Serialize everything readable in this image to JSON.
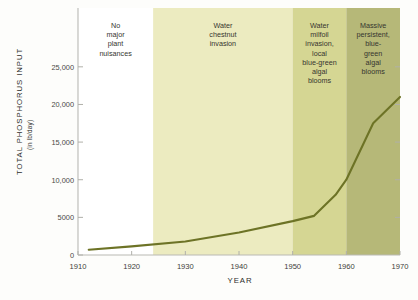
{
  "chart_data": {
    "type": "line",
    "title": "",
    "xlabel": "YEAR",
    "ylabel": "TOTAL PHOSPHORUS INPUT",
    "ylabel_units": "(in lb/day)",
    "xlim": [
      1910,
      1970
    ],
    "ylim": [
      0,
      27500
    ],
    "grid": false,
    "legend": "none",
    "xticks": [
      1910,
      1920,
      1930,
      1940,
      1950,
      1960,
      1970
    ],
    "xtick_labels": [
      "1910",
      "1920",
      "1930",
      "1940",
      "1950",
      "1960",
      "1970"
    ],
    "yticks": [
      0,
      5000,
      10000,
      15000,
      20000,
      25000
    ],
    "ytick_labels": [
      "0",
      "5000",
      "10,000",
      "15,000",
      "20,000",
      "25,000"
    ],
    "series": [
      {
        "name": "Total phosphorus input",
        "color": "#6d7326",
        "x": [
          1912,
          1920,
          1930,
          1940,
          1950,
          1954,
          1958,
          1960,
          1965,
          1970
        ],
        "values": [
          700,
          1150,
          1800,
          3000,
          4500,
          5200,
          8000,
          10000,
          17500,
          21000
        ]
      }
    ],
    "annotations": [
      {
        "label": "No major plant nuisances",
        "lines": [
          "No",
          "major",
          "plant",
          "nuisances"
        ],
        "x_start": 1910,
        "x_end": 1924,
        "color": "#ffffff"
      },
      {
        "label": "Water chestnut invasion",
        "lines": [
          "Water",
          "chestnut",
          "invasion"
        ],
        "x_start": 1924,
        "x_end": 1950,
        "color": "#ecebc0"
      },
      {
        "label": "Water milfoil invasion, local blue-green algal blooms",
        "lines": [
          "Water",
          "milfoil",
          "invasion,",
          "local",
          "blue-green",
          "algal",
          "blooms"
        ],
        "x_start": 1950,
        "x_end": 1960,
        "color": "#d5d693"
      },
      {
        "label": "Massive persistent, blue-green algal blooms",
        "lines": [
          "Massive",
          "persistent,",
          "blue-",
          "green",
          "algal",
          "blooms"
        ],
        "x_start": 1960,
        "x_end": 1970,
        "color": "#b6b878"
      }
    ]
  }
}
